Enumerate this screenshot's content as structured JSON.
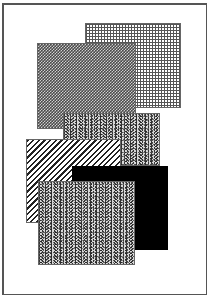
{
  "figure": {
    "frame": {
      "x": 2,
      "y": 3,
      "width": 205,
      "height": 292
    },
    "rectangles": [
      {
        "id": "grid-square",
        "pattern": "grid",
        "x": 85,
        "y": 23,
        "width": 96,
        "height": 85,
        "z": 1
      },
      {
        "id": "dark-checker-square",
        "pattern": "checker",
        "x": 37,
        "y": 43,
        "width": 99,
        "height": 86,
        "z": 2
      },
      {
        "id": "noise-rect-top",
        "pattern": "noise",
        "x": 63,
        "y": 113,
        "width": 97,
        "height": 53,
        "z": 3
      },
      {
        "id": "striped-rect",
        "pattern": "diagonal-stripes",
        "x": 26,
        "y": 139,
        "width": 95,
        "height": 84,
        "z": 4
      },
      {
        "id": "black-rect",
        "pattern": "solid",
        "color": "#000000",
        "x": 72,
        "y": 166,
        "width": 96,
        "height": 84,
        "z": 5
      },
      {
        "id": "noise-rect-bottom",
        "pattern": "noise",
        "x": 38,
        "y": 181,
        "width": 97,
        "height": 84,
        "z": 6
      }
    ]
  }
}
